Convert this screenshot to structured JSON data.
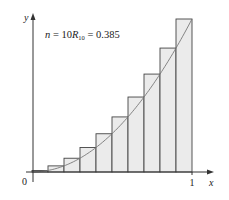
{
  "chart_data": {
    "type": "bar",
    "title": "",
    "annotation": {
      "n_label": "n",
      "n_value": "10",
      "r_label": "R",
      "r_sub": "10",
      "r_value": "0.385"
    },
    "xlabel": "x",
    "ylabel": "y",
    "x_ticks": [
      {
        "value": 0,
        "label": "0"
      },
      {
        "value": 1,
        "label": "1"
      }
    ],
    "xlim": [
      0,
      1
    ],
    "ylim": [
      0,
      1
    ],
    "curve": "y = x^2",
    "method": "right-endpoint Riemann sum",
    "categories": [
      "0.1",
      "0.2",
      "0.3",
      "0.4",
      "0.5",
      "0.6",
      "0.7",
      "0.8",
      "0.9",
      "1.0"
    ],
    "values": [
      0.01,
      0.04,
      0.09,
      0.16,
      0.25,
      0.36,
      0.49,
      0.64,
      0.81,
      1.0
    ],
    "bar_width": 0.1,
    "grid": false,
    "legend": null
  },
  "colors": {
    "bar_fill": "#ebebeb",
    "bar_stroke": "#444444",
    "curve": "#777777",
    "axis": "#333333",
    "text": "#222222"
  }
}
